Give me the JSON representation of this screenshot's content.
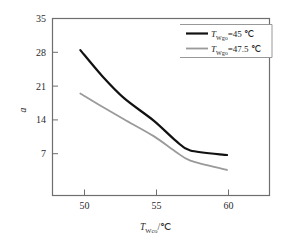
{
  "chart_data": {
    "type": "line",
    "title": "",
    "subtitle": "",
    "xlabel_prefix": "T",
    "xlabel_sub": "Wco",
    "xlabel_suffix": "/℃",
    "xlabel": "T_Wco/℃",
    "ylabel": "a",
    "xlim": [
      48.1,
      62.9
    ],
    "ylim": [
      3.1,
      35
    ],
    "xticks": [
      50,
      55,
      60
    ],
    "xtick_labels": [
      "50",
      "55",
      "60"
    ],
    "yticks": [
      7,
      14,
      21,
      28,
      35
    ],
    "ytick_labels": [
      "7",
      "14",
      "21",
      "28",
      "35"
    ],
    "grid": false,
    "legend_position": "top-right",
    "x": [
      50,
      51.5,
      53,
      55,
      56.5,
      57.5,
      60
    ],
    "series": [
      {
        "name": "T_Wgo=45 ℃",
        "label_prefix": "T",
        "label_sub": "Wgo",
        "label_suffix": "=45 ℃",
        "color": "#111111",
        "width": 2.2,
        "values": [
          29.3,
          24.6,
          20.6,
          16.6,
          13.0,
          11.2,
          10.4
        ]
      },
      {
        "name": "T_Wgo=47.5 ℃",
        "label_prefix": "T",
        "label_sub": "Wgo",
        "label_suffix": "=47.5 ℃",
        "color": "#9a9a9a",
        "width": 1.8,
        "values": [
          21.5,
          19.1,
          16.8,
          13.8,
          11.0,
          9.4,
          7.7
        ]
      }
    ]
  },
  "axes": {
    "x_ticks": [
      "50",
      "55",
      "60"
    ],
    "y_ticks": [
      "35",
      "28",
      "21",
      "14",
      "7"
    ],
    "y_title": "a",
    "x_title_main": "T",
    "x_title_sub": "Wco",
    "x_title_unit": "/℃"
  },
  "legend": {
    "entries": [
      {
        "prefix": "T",
        "sub": "Wgo",
        "suffix": "=45 ℃"
      },
      {
        "prefix": "T",
        "sub": "Wgo",
        "suffix": "=47.5 ℃"
      }
    ]
  }
}
